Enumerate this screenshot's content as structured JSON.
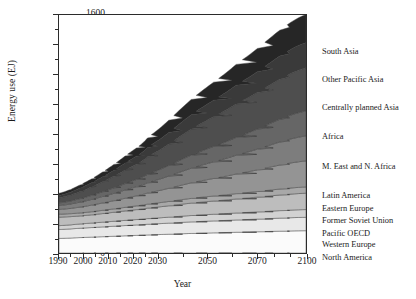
{
  "chart_data": {
    "type": "area",
    "title": "",
    "xlabel": "Year",
    "ylabel": "Energy use (EJ)",
    "ylim": [
      0,
      1600
    ],
    "xlim": [
      1990,
      2100
    ],
    "grid": false,
    "legend_position": "right",
    "stacked": true,
    "y_ticks": [
      0,
      200,
      400,
      600,
      800,
      1000,
      1200,
      1400,
      1600
    ],
    "y_tick_labels": [
      "0",
      "200",
      "400",
      "600",
      "800",
      "1000",
      "1200",
      "1400",
      "1600"
    ],
    "y_minor_ticks": [
      100,
      300,
      500,
      700,
      900,
      1100,
      1300,
      1500
    ],
    "x_ticks": [
      1990,
      2000,
      2010,
      2020,
      2030,
      2050,
      2070,
      2100
    ],
    "x_tick_labels": [
      "1990",
      "2000",
      "2010",
      "2020",
      "2030",
      "2050",
      "2070",
      "2100"
    ],
    "x_minor_ticks": [
      1995,
      2005,
      2015,
      2025,
      2040,
      2060,
      2080,
      2090
    ],
    "x": [
      1990,
      2000,
      2010,
      2020,
      2030,
      2050,
      2070,
      2100
    ],
    "series": [
      {
        "name": "North America",
        "color": "#fbfbfb",
        "values": [
          98,
          104,
          110,
          116,
          122,
          132,
          140,
          150
        ]
      },
      {
        "name": "Western Europe",
        "color": "#e8e8e8",
        "values": [
          60,
          63,
          66,
          69,
          72,
          78,
          83,
          90
        ]
      },
      {
        "name": "Pacific OECD",
        "color": "#d2d2d2",
        "values": [
          26,
          29,
          32,
          35,
          38,
          43,
          47,
          52
        ]
      },
      {
        "name": "Former Soviet Union",
        "color": "#bdbdbd",
        "values": [
          57,
          54,
          58,
          64,
          71,
          84,
          95,
          110
        ]
      },
      {
        "name": "Eastern Europe",
        "color": "#a8a8a8",
        "values": [
          20,
          20,
          22,
          24,
          27,
          32,
          36,
          42
        ]
      },
      {
        "name": "Latin America",
        "color": "#949494",
        "values": [
          32,
          40,
          50,
          62,
          76,
          106,
          134,
          175
        ]
      },
      {
        "name": "M. East and N. Africa",
        "color": "#7d7d7d",
        "values": [
          26,
          34,
          44,
          56,
          70,
          100,
          128,
          168
        ]
      },
      {
        "name": "Africa",
        "color": "#666666",
        "values": [
          18,
          24,
          33,
          44,
          58,
          90,
          122,
          168
        ]
      },
      {
        "name": "Centrally planned Asia",
        "color": "#4e4e4e",
        "values": [
          34,
          48,
          68,
          92,
          120,
          178,
          228,
          290
        ]
      },
      {
        "name": "Other Pacific Asia",
        "color": "#3a3a3a",
        "values": [
          16,
          24,
          34,
          48,
          64,
          98,
          128,
          168
        ]
      },
      {
        "name": "South Asia",
        "color": "#262626",
        "values": [
          15,
          22,
          33,
          48,
          66,
          105,
          142,
          190
        ]
      }
    ],
    "legend_entries": [
      {
        "label": "South Asia",
        "y": 48
      },
      {
        "label": "Other Pacific Asia",
        "y": 76
      },
      {
        "label": "Centrally planned Asia",
        "y": 104
      },
      {
        "label": "Africa",
        "y": 133
      },
      {
        "label": "M. East and N. Africa",
        "y": 163
      },
      {
        "label": "Latin America",
        "y": 192
      },
      {
        "label": "Eastern Europe",
        "y": 205
      },
      {
        "label": "Former Soviet Union",
        "y": 217
      },
      {
        "label": "Pacific OECD",
        "y": 230
      },
      {
        "label": "Western Europe",
        "y": 241
      },
      {
        "label": "North America",
        "y": 254
      }
    ]
  }
}
